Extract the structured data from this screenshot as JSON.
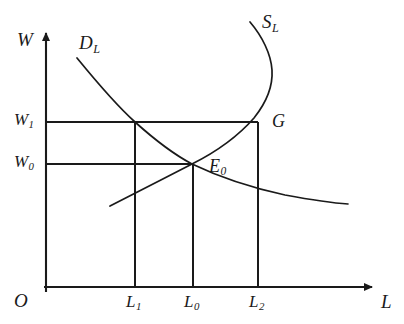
{
  "figure": {
    "kind": "economics-diagram",
    "topic": "labor-market-backward-bending-supply",
    "stroke_color": "#1a1a1a",
    "background_color": "#ffffff"
  },
  "axes": {
    "origin_label": "O",
    "y_axis": {
      "name": "W",
      "label": "W",
      "arrow": true
    },
    "x_axis": {
      "name": "L",
      "label": "L",
      "arrow": true
    }
  },
  "curves": [
    {
      "id": "demand",
      "label": "D",
      "subscript": "L",
      "shape": "downward-sloping convex",
      "points": [
        [
          77,
          58
        ],
        [
          100,
          83
        ],
        [
          120,
          104
        ],
        [
          135,
          122
        ],
        [
          155,
          140
        ],
        [
          175,
          155
        ],
        [
          192,
          164
        ],
        [
          215,
          174
        ],
        [
          245,
          185
        ],
        [
          280,
          194
        ],
        [
          315,
          200
        ],
        [
          348,
          204
        ]
      ]
    },
    {
      "id": "supply",
      "label": "S",
      "subscript": "L",
      "shape": "backward-bending",
      "points": [
        [
          110,
          206
        ],
        [
          135,
          193
        ],
        [
          160,
          180
        ],
        [
          192,
          164
        ],
        [
          215,
          152
        ],
        [
          238,
          136
        ],
        [
          252,
          122
        ],
        [
          264,
          104
        ],
        [
          272,
          82
        ],
        [
          271,
          62
        ],
        [
          263,
          42
        ],
        [
          250,
          22
        ]
      ]
    }
  ],
  "points": [
    {
      "id": "E0",
      "label": "E",
      "subscript": "0",
      "x": 192,
      "y": 164,
      "meaning": "equilibrium"
    },
    {
      "id": "G",
      "label": "G",
      "subscript": "",
      "x": 258,
      "y": 122,
      "meaning": "supply at higher wage"
    }
  ],
  "y_ticks": [
    {
      "label": "W",
      "subscript": "1",
      "y": 122
    },
    {
      "label": "W",
      "subscript": "0",
      "y": 164
    }
  ],
  "x_ticks": [
    {
      "label": "L",
      "subscript": "1",
      "x": 135
    },
    {
      "label": "L",
      "subscript": "0",
      "x": 193
    },
    {
      "label": "L",
      "subscript": "2",
      "x": 258
    }
  ],
  "guide_lines": {
    "horizontal": [
      {
        "from_axis_x": 46,
        "to_x": 258,
        "y": 122,
        "tick": "W1"
      },
      {
        "from_axis_x": 46,
        "to_x": 192,
        "y": 164,
        "tick": "W0"
      }
    ],
    "vertical": [
      {
        "x": 135,
        "from_y": 122,
        "to_axis_y": 287,
        "tick": "L1"
      },
      {
        "x": 193,
        "from_y": 164,
        "to_axis_y": 287,
        "tick": "L0"
      },
      {
        "x": 258,
        "from_y": 122,
        "to_axis_y": 287,
        "tick": "L2"
      }
    ]
  }
}
